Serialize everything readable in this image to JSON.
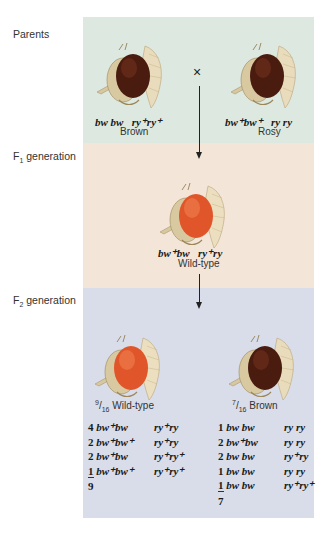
{
  "labels": {
    "parents": "Parents",
    "f1_prefix": "F",
    "f1_sub": "1",
    "f1_suffix": " generation",
    "f2_prefix": "F",
    "f2_sub": "2",
    "f2_suffix": " generation"
  },
  "colors": {
    "parents_panel": "#dde9e0",
    "f1_panel": "#f4e5d9",
    "f2_panel": "#d9dde9",
    "brown_eye": "#4a1c10",
    "wildtype_eye": "#e0562a"
  },
  "parents": {
    "cross_symbol": "×",
    "left": {
      "phenotype": "Brown",
      "eye": "brown",
      "geno_bw": "bw bw",
      "geno_ry": "ry⁺ry⁺"
    },
    "right": {
      "phenotype": "Rosy",
      "eye": "brown",
      "geno_bw": "bw⁺bw⁺",
      "geno_ry": "ry ry"
    }
  },
  "f1": {
    "phenotype": "Wild-type",
    "eye": "red",
    "geno_bw": "bw⁺bw",
    "geno_ry": "ry⁺ry"
  },
  "f2": {
    "left": {
      "fraction_num": "9",
      "fraction_den": "16",
      "phenotype": " Wild-type",
      "eye": "red",
      "rows": [
        {
          "count": "4",
          "bw": "bw⁺bw",
          "ry": "ry⁺ry"
        },
        {
          "count": "2",
          "bw": "bw⁺bw⁺",
          "ry": "ry⁺ry"
        },
        {
          "count": "2",
          "bw": "bw⁺bw",
          "ry": "ry⁺ry⁺"
        },
        {
          "count": "1",
          "bw": "bw⁺bw⁺",
          "ry": "ry⁺ry⁺"
        }
      ],
      "total": "9"
    },
    "right": {
      "fraction_num": "7",
      "fraction_den": "16",
      "phenotype": " Brown",
      "eye": "brown",
      "rows": [
        {
          "count": "1",
          "bw": "bw bw",
          "ry": "ry ry"
        },
        {
          "count": "2",
          "bw": "bw⁺bw",
          "ry": "ry ry"
        },
        {
          "count": "2",
          "bw": "bw bw",
          "ry": "ry⁺ry"
        },
        {
          "count": "1",
          "bw": "bw bw",
          "ry": "ry ry"
        },
        {
          "count": "1",
          "bw": "bw bw",
          "ry": "ry⁺ry⁺"
        }
      ],
      "total": "7"
    }
  }
}
